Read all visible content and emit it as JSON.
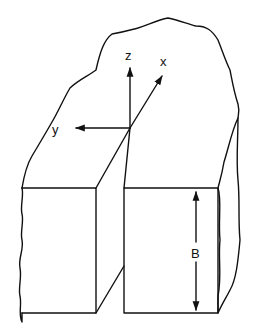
{
  "diagram": {
    "axes": {
      "x_label": "x",
      "y_label": "y",
      "z_label": "z"
    },
    "dimension_label": "B",
    "colors": {
      "line": "#111111",
      "background": "#ffffff"
    }
  }
}
